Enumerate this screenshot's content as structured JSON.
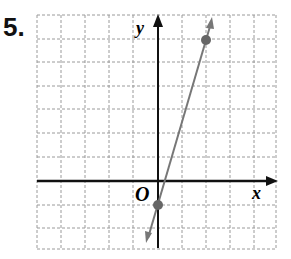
{
  "problem_number": "5.",
  "chart_data": {
    "type": "line",
    "title": "",
    "xlabel": "x",
    "ylabel": "y",
    "origin_label": "O",
    "xlim": [
      -5,
      5
    ],
    "ylim": [
      -3,
      7
    ],
    "grid": true,
    "points": [
      {
        "x": 0,
        "y": -1
      },
      {
        "x": 2,
        "y": 6
      }
    ],
    "line": {
      "slope": 3.5,
      "intercept": -1
    },
    "colors": {
      "line": "#777777",
      "point": "#666666",
      "axis": "#111111",
      "grid": "#999999"
    }
  }
}
